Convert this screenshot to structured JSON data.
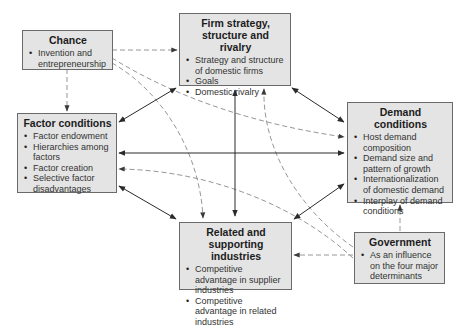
{
  "diagram": {
    "type": "Porter's Diamond model",
    "nodes": {
      "chance": {
        "title": "Chance",
        "items": [
          "Invention and entrepreneurship"
        ]
      },
      "firm": {
        "title": "Firm strategy, structure and rivalry",
        "items": [
          "Strategy and structure of domestic firms",
          "Goals",
          "Domestic rivalry"
        ]
      },
      "factor": {
        "title": "Factor conditions",
        "items": [
          "Factor endowment",
          "Hierarchies among factors",
          "Factor creation",
          "Selective factor disadvantages"
        ]
      },
      "demand": {
        "title": "Demand conditions",
        "items": [
          "Host demand composition",
          "Demand size and pattern of growth",
          "Internationalization of domestic demand",
          "Interplay of demand conditions"
        ]
      },
      "related": {
        "title": "Related and supporting industries",
        "items": [
          "Competitive advantage in supplier industries",
          "Competitive advantage in related industries"
        ]
      },
      "government": {
        "title": "Government",
        "items": [
          "As an influence on the four major determinants"
        ]
      }
    },
    "edges": [
      {
        "from": "chance",
        "to": "firm",
        "style": "dashed",
        "direction": "one-way"
      },
      {
        "from": "chance",
        "to": "factor",
        "style": "dashed",
        "direction": "one-way"
      },
      {
        "from": "chance",
        "to": "demand",
        "style": "dashed",
        "direction": "one-way"
      },
      {
        "from": "chance",
        "to": "related",
        "style": "dashed",
        "direction": "one-way"
      },
      {
        "from": "firm",
        "to": "factor",
        "style": "solid",
        "direction": "two-way"
      },
      {
        "from": "firm",
        "to": "demand",
        "style": "solid",
        "direction": "two-way"
      },
      {
        "from": "firm",
        "to": "related",
        "style": "solid",
        "direction": "two-way"
      },
      {
        "from": "factor",
        "to": "demand",
        "style": "solid",
        "direction": "two-way"
      },
      {
        "from": "factor",
        "to": "related",
        "style": "solid",
        "direction": "two-way"
      },
      {
        "from": "demand",
        "to": "related",
        "style": "solid",
        "direction": "two-way"
      },
      {
        "from": "government",
        "to": "firm",
        "style": "dashed",
        "direction": "one-way"
      },
      {
        "from": "government",
        "to": "factor",
        "style": "dashed",
        "direction": "one-way"
      },
      {
        "from": "government",
        "to": "demand",
        "style": "dashed",
        "direction": "one-way"
      },
      {
        "from": "government",
        "to": "related",
        "style": "dashed",
        "direction": "one-way"
      }
    ],
    "colors": {
      "box_fill": "#e4e4e4",
      "box_border": "#6a6a6a",
      "solid_line": "#2a2a2a",
      "dashed_line": "#8a8a8a"
    }
  }
}
